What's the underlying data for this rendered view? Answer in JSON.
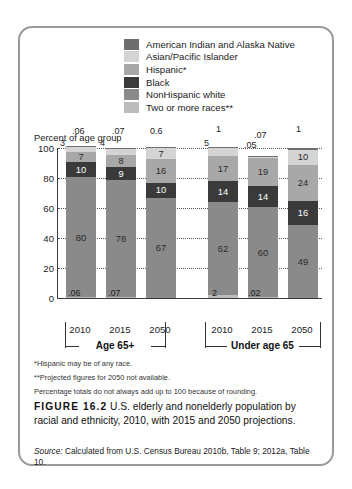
{
  "legend": {
    "items": [
      {
        "label": "American Indian and Alaska Native",
        "color": "#6e6e6e"
      },
      {
        "label": "Asian/Pacific Islander",
        "color": "#d4d4d4"
      },
      {
        "label": "Hispanic*",
        "color": "#a8a8a8"
      },
      {
        "label": "Black",
        "color": "#3a3a3a"
      },
      {
        "label": "NonHispanic white",
        "color": "#8a8a8a"
      },
      {
        "label": "Two or more races**",
        "color": "#bcbcbc"
      }
    ]
  },
  "axis_caption": "Percent of age group",
  "groups": [
    {
      "name": "Age 65+"
    },
    {
      "name": "Under age 65"
    }
  ],
  "notes": [
    "*Hispanic may be of any race.",
    "**Projected figures for 2050 not available.",
    "Percentage totals do not always add up to 100 because of rounding."
  ],
  "caption": {
    "figure_number": "FIGURE 16.2",
    "text": " U.S. elderly and nonelderly population by racial and ethnicity, 2010, with 2015 and 2050 projections."
  },
  "source": {
    "label": "Source:",
    "text": " Calculated from U.S. Census Bureau 2010b, Table 9; 2012a, Table 10."
  },
  "chart_data": {
    "type": "bar",
    "subtype": "stacked-bar",
    "title": "U.S. elderly and nonelderly population by racial and ethnicity, 2010, with 2015 and 2050 projections",
    "xlabel": "",
    "ylabel": "Percent of age group",
    "ylim": [
      0,
      100
    ],
    "yticks": [
      0,
      20,
      40,
      60,
      80,
      100
    ],
    "grid": true,
    "legend_position": "top-right",
    "categories": [
      "2010",
      "2015",
      "2050",
      "2010",
      "2015",
      "2050"
    ],
    "group_labels": [
      "Age 65+",
      "Age 65+",
      "Age 65+",
      "Under age 65",
      "Under age 65",
      "Under age 65"
    ],
    "series": [
      {
        "name": "Two or more races**",
        "color": "#bcbcbc",
        "values": [
          0.06,
          0.07,
          null,
          2,
          0.02,
          null
        ]
      },
      {
        "name": "NonHispanic white",
        "color": "#8a8a8a",
        "values": [
          80,
          78,
          67,
          62,
          60,
          49
        ]
      },
      {
        "name": "Black",
        "color": "#3a3a3a",
        "values": [
          10,
          9,
          10,
          14,
          14,
          16
        ]
      },
      {
        "name": "Hispanic*",
        "color": "#a8a8a8",
        "values": [
          7,
          8,
          16,
          17,
          19,
          24
        ]
      },
      {
        "name": "Asian/Pacific Islander",
        "color": "#d4d4d4",
        "values": [
          3,
          4,
          7,
          5,
          0.05,
          10
        ]
      },
      {
        "name": "American Indian and Alaska Native",
        "color": "#6e6e6e",
        "values": [
          0.06,
          0.07,
          0.6,
          1,
          0.07,
          1
        ]
      }
    ],
    "bars": [
      {
        "x": "2010",
        "group": "Age 65+",
        "segments": [
          {
            "series": "Two or more races**",
            "value": 0.06,
            "display": ".06",
            "callout": "bottom"
          },
          {
            "series": "NonHispanic white",
            "value": 80,
            "display": "80"
          },
          {
            "series": "Black",
            "value": 10,
            "display": "10"
          },
          {
            "series": "Hispanic*",
            "value": 7,
            "display": "7"
          },
          {
            "series": "Asian/Pacific Islander",
            "value": 3,
            "display": "3",
            "callout": "top"
          },
          {
            "series": "American Indian and Alaska Native",
            "value": 0.06,
            "display": ".06",
            "callout": "top"
          }
        ]
      },
      {
        "x": "2015",
        "group": "Age 65+",
        "segments": [
          {
            "series": "Two or more races**",
            "value": 0.07,
            "display": ".07",
            "callout": "bottom"
          },
          {
            "series": "NonHispanic white",
            "value": 78,
            "display": "78"
          },
          {
            "series": "Black",
            "value": 9,
            "display": "9"
          },
          {
            "series": "Hispanic*",
            "value": 8,
            "display": "8"
          },
          {
            "series": "Asian/Pacific Islander",
            "value": 4,
            "display": "4",
            "callout": "top"
          },
          {
            "series": "American Indian and Alaska Native",
            "value": 0.07,
            "display": ".07",
            "callout": "top"
          }
        ]
      },
      {
        "x": "2050",
        "group": "Age 65+",
        "segments": [
          {
            "series": "NonHispanic white",
            "value": 67,
            "display": "67"
          },
          {
            "series": "Black",
            "value": 10,
            "display": "10"
          },
          {
            "series": "Hispanic*",
            "value": 16,
            "display": "16"
          },
          {
            "series": "Asian/Pacific Islander",
            "value": 7,
            "display": "7"
          },
          {
            "series": "American Indian and Alaska Native",
            "value": 0.6,
            "display": "0.6",
            "callout": "top"
          }
        ]
      },
      {
        "x": "2010",
        "group": "Under age 65",
        "segments": [
          {
            "series": "Two or more races**",
            "value": 2,
            "display": "2",
            "callout": "bottom"
          },
          {
            "series": "NonHispanic white",
            "value": 62,
            "display": "62"
          },
          {
            "series": "Black",
            "value": 14,
            "display": "14"
          },
          {
            "series": "Hispanic*",
            "value": 17,
            "display": "17"
          },
          {
            "series": "Asian/Pacific Islander",
            "value": 5,
            "display": "5",
            "callout": "top"
          },
          {
            "series": "American Indian and Alaska Native",
            "value": 1,
            "display": "1",
            "callout": "top"
          }
        ]
      },
      {
        "x": "2015",
        "group": "Under age 65",
        "segments": [
          {
            "series": "Two or more races**",
            "value": 0.02,
            "display": ".02",
            "callout": "bottom"
          },
          {
            "series": "NonHispanic white",
            "value": 60,
            "display": "60"
          },
          {
            "series": "Black",
            "value": 14,
            "display": "14"
          },
          {
            "series": "Hispanic*",
            "value": 19,
            "display": "19"
          },
          {
            "series": "Asian/Pacific Islander",
            "value": 0.05,
            "display": ".05",
            "callout": "top"
          },
          {
            "series": "American Indian and Alaska Native",
            "value": 0.07,
            "display": ".07",
            "callout": "top"
          }
        ]
      },
      {
        "x": "2050",
        "group": "Under age 65",
        "segments": [
          {
            "series": "NonHispanic white",
            "value": 49,
            "display": "49"
          },
          {
            "series": "Black",
            "value": 16,
            "display": "16"
          },
          {
            "series": "Hispanic*",
            "value": 24,
            "display": "24"
          },
          {
            "series": "Asian/Pacific Islander",
            "value": 10,
            "display": "10"
          },
          {
            "series": "American Indian and Alaska Native",
            "value": 1,
            "display": "1",
            "callout": "top"
          }
        ]
      }
    ]
  }
}
